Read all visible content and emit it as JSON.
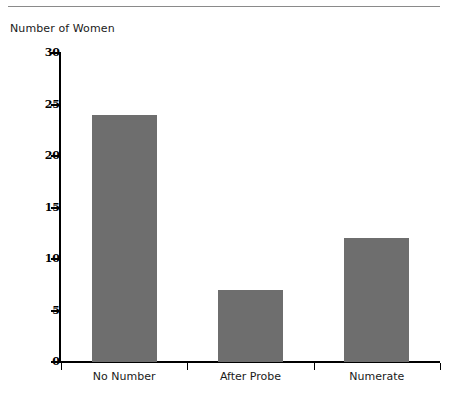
{
  "figure": {
    "y_axis_caption": "Number of Women",
    "bar_color": "#6e6e6e",
    "axis_color": "#000000",
    "rule_color": "#8a8a8a",
    "background": "#ffffff"
  },
  "chart_data": {
    "type": "bar",
    "title": "",
    "subtitle": "",
    "xlabel": "",
    "ylabel": "Number of Women",
    "categories": [
      "No Number",
      "After Probe",
      "Numerate"
    ],
    "values": [
      24,
      7,
      12
    ],
    "series": [
      {
        "name": "Number of Women",
        "values": [
          24,
          7,
          12
        ]
      }
    ],
    "ylim": [
      0,
      30
    ],
    "ytick_labels": [
      "0",
      "5",
      "10",
      "15",
      "20",
      "25",
      "30"
    ],
    "ytick_values": [
      0,
      5,
      10,
      15,
      20,
      25,
      30
    ],
    "grid": false,
    "legend": false,
    "legend_position": "none",
    "annotations": []
  }
}
